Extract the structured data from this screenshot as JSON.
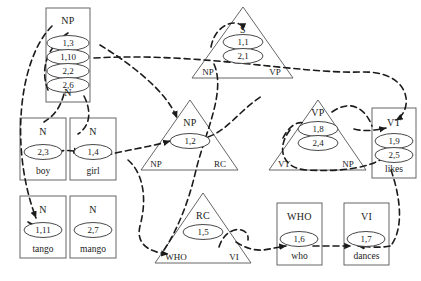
{
  "diagram": {
    "ink": "#333333",
    "edge_color": "#1b1b1b",
    "boxes": [
      {
        "id": "np-top",
        "label": "NP",
        "word": "N",
        "ovals": [
          "1,3",
          "1,10",
          "2,2",
          "2,6"
        ]
      },
      {
        "id": "n-boy",
        "label": "N",
        "word": "boy",
        "ovals": [
          "2,3"
        ]
      },
      {
        "id": "n-girl",
        "label": "N",
        "word": "girl",
        "ovals": [
          "1,4"
        ]
      },
      {
        "id": "n-tango",
        "label": "N",
        "word": "tango",
        "ovals": [
          "1,11"
        ]
      },
      {
        "id": "n-mango",
        "label": "N",
        "word": "mango",
        "ovals": [
          "2,7"
        ]
      },
      {
        "id": "vt-likes",
        "label": "VT",
        "word": "likes",
        "ovals": [
          "1,9",
          "2,5"
        ]
      },
      {
        "id": "who-who",
        "label": "WHO",
        "word": "who",
        "ovals": [
          "1,6"
        ]
      },
      {
        "id": "vi-dances",
        "label": "VI",
        "word": "dances",
        "ovals": [
          "1,7"
        ]
      }
    ],
    "triangles": [
      {
        "id": "tri-s",
        "label": "S",
        "ovals": [
          "1,1",
          "2,1"
        ],
        "left_base": "NP",
        "right_base": "VP"
      },
      {
        "id": "tri-np",
        "label": "NP",
        "ovals": [
          "1,2"
        ],
        "left_base": "NP",
        "right_base": "RC"
      },
      {
        "id": "tri-vp",
        "label": "VP",
        "ovals": [
          "1,8",
          "2,4"
        ],
        "left_base": "VT",
        "right_base": "NP"
      },
      {
        "id": "tri-rc",
        "label": "RC",
        "ovals": [
          "1,5"
        ],
        "left_base": "WHO",
        "right_base": "VI"
      }
    ],
    "labels": {
      "np_top_cat": "NP",
      "np_top_word": "N",
      "np_top_o1": "1,3",
      "np_top_o2": "1,10",
      "np_top_o3": "2,2",
      "np_top_o4": "2,6",
      "boy_cat": "N",
      "boy_word": "boy",
      "boy_o1": "2,3",
      "girl_cat": "N",
      "girl_word": "girl",
      "girl_o1": "1,4",
      "tango_cat": "N",
      "tango_word": "tango",
      "tango_o1": "1,11",
      "mango_cat": "N",
      "mango_word": "mango",
      "mango_o1": "2,7",
      "vt_cat": "VT",
      "vt_word": "likes",
      "vt_o1": "1,9",
      "vt_o2": "2,5",
      "who_cat": "WHO",
      "who_word": "who",
      "who_o1": "1,6",
      "vi_cat": "VI",
      "vi_word": "dances",
      "vi_o1": "1,7",
      "s_cat": "S",
      "s_o1": "1,1",
      "s_o2": "2,1",
      "s_base_l": "NP",
      "s_base_r": "VP",
      "npt_cat": "NP",
      "npt_o1": "1,2",
      "npt_base_l": "NP",
      "npt_base_r": "RC",
      "vp_cat": "VP",
      "vp_o1": "1,8",
      "vp_o2": "2,4",
      "vp_base_l": "VT",
      "vp_base_r": "NP",
      "rc_cat": "RC",
      "rc_o1": "1,5",
      "rc_base_l": "WHO",
      "rc_base_r": "VI"
    }
  }
}
